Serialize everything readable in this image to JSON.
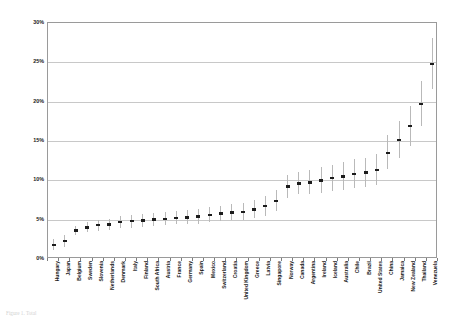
{
  "chart_data": {
    "type": "scatter",
    "title": "",
    "xlabel": "",
    "ylabel": "Percentage of Adult Population Between 18-64 Years",
    "ylim": [
      0,
      30
    ],
    "ytick_labels": [
      "0%",
      "5%",
      "10%",
      "15%",
      "20%",
      "25%",
      "30%"
    ],
    "ytick_values": [
      0,
      5,
      10,
      15,
      20,
      25,
      30
    ],
    "grid": true,
    "legend": "none",
    "categories": [
      "Hungary",
      "Japan",
      "Belgium",
      "Sweden",
      "Slovenia",
      "Netherlands",
      "Denmark",
      "Italy",
      "Finland",
      "South Africa",
      "Austria",
      "France",
      "Germany",
      "Spain",
      "Mexico",
      "Switzerland",
      "Croatia",
      "United Kingdom",
      "Greece",
      "Latvia",
      "Singapore",
      "Norway",
      "Canada",
      "Argentina",
      "Ireland",
      "Iceland",
      "Australia",
      "Chile",
      "Brazil",
      "United States",
      "China",
      "Jamaica",
      "New Zealand",
      "Thailand",
      "Venezuela"
    ],
    "values": [
      1.8,
      2.3,
      3.6,
      4.0,
      4.3,
      4.4,
      4.7,
      4.8,
      4.9,
      5.0,
      5.1,
      5.2,
      5.3,
      5.4,
      5.6,
      5.8,
      5.9,
      6.0,
      6.3,
      6.7,
      7.4,
      9.2,
      9.6,
      9.7,
      10.0,
      10.3,
      10.5,
      10.8,
      11.0,
      11.3,
      13.5,
      15.1,
      16.9,
      19.7,
      24.8
    ],
    "error_low": [
      1.2,
      1.5,
      3.0,
      3.4,
      3.6,
      3.7,
      3.9,
      4.0,
      4.1,
      4.2,
      4.3,
      4.4,
      4.4,
      4.5,
      4.7,
      4.8,
      4.9,
      5.0,
      5.2,
      5.5,
      6.1,
      7.8,
      8.2,
      8.2,
      8.4,
      8.7,
      8.8,
      9.0,
      9.2,
      9.4,
      11.4,
      12.8,
      14.4,
      16.9,
      21.6
    ],
    "error_high": [
      2.5,
      3.1,
      4.2,
      4.7,
      5.0,
      5.1,
      5.5,
      5.6,
      5.7,
      5.9,
      6.0,
      6.1,
      6.2,
      6.4,
      6.6,
      6.8,
      7.0,
      7.1,
      7.5,
      8.0,
      8.8,
      10.7,
      11.1,
      11.3,
      11.7,
      12.0,
      12.3,
      12.7,
      12.9,
      13.3,
      15.7,
      17.5,
      19.5,
      22.6,
      28.1
    ],
    "ylabel_suffix": "%"
  },
  "caption": {
    "text": "Figure 1. Total"
  }
}
